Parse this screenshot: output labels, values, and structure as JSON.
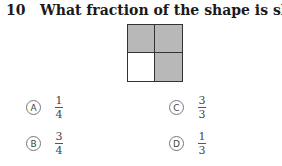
{
  "question": {
    "number": "10",
    "text": "What fraction of the shape is shaded?"
  },
  "shape": {
    "grid": "2x2",
    "cells": [
      {
        "position": "top-left",
        "shaded": true
      },
      {
        "position": "top-right",
        "shaded": true
      },
      {
        "position": "bottom-left",
        "shaded": false
      },
      {
        "position": "bottom-right",
        "shaded": true
      }
    ],
    "shade_color": "#b8b8b8",
    "unshaded_color": "#ffffff"
  },
  "options": [
    {
      "letter": "A",
      "numerator": "1",
      "denominator": "4"
    },
    {
      "letter": "B",
      "numerator": "3",
      "denominator": "4"
    },
    {
      "letter": "C",
      "numerator": "3",
      "denominator": "3"
    },
    {
      "letter": "D",
      "numerator": "1",
      "denominator": "3"
    }
  ]
}
